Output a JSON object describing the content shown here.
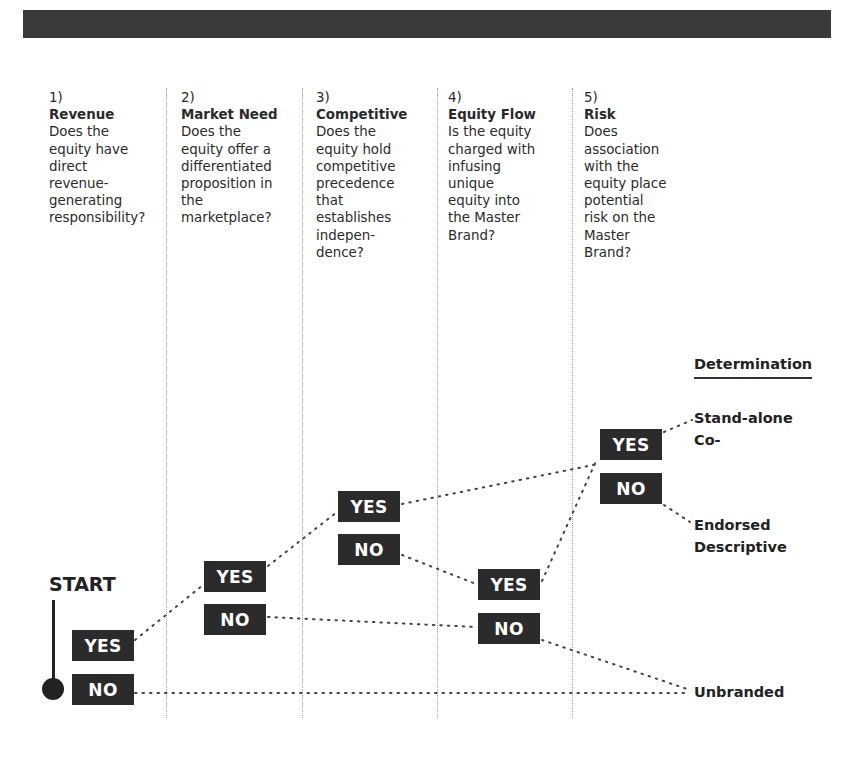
{
  "header_bar": {
    "color": "#3a3a3a"
  },
  "columns": [
    {
      "num": "1)",
      "title": "Revenue",
      "question": [
        "Does the",
        "equity have",
        "direct",
        "revenue-",
        "generating",
        "responsibility?"
      ]
    },
    {
      "num": "2)",
      "title": "Market Need",
      "question": [
        "Does the",
        "equity offer a",
        "differentiated",
        "proposition in",
        "the",
        "marketplace?"
      ]
    },
    {
      "num": "3)",
      "title": "Competitive",
      "question": [
        "Does the",
        "equity hold",
        "competitive",
        "precedence",
        "that",
        "establishes",
        "indepen-",
        "dence?"
      ]
    },
    {
      "num": "4)",
      "title": "Equity Flow",
      "question": [
        "Is the equity",
        "charged with",
        "infusing",
        "unique",
        "equity into",
        "the Master",
        "Brand?"
      ]
    },
    {
      "num": "5)",
      "title": "Risk",
      "question": [
        "Does",
        "association",
        "with the",
        "equity place",
        "potential",
        "risk on the",
        "Master",
        "Brand?"
      ]
    }
  ],
  "start_label": "START",
  "decisions": [
    {
      "yes": "YES",
      "no": "NO"
    },
    {
      "yes": "YES",
      "no": "NO"
    },
    {
      "yes": "YES",
      "no": "NO"
    },
    {
      "yes": "YES",
      "no": "NO"
    },
    {
      "yes": "YES",
      "no": "NO"
    }
  ],
  "determination": {
    "heading": "Determination",
    "outcomes": [
      "Stand-alone",
      "Co-",
      "Endorsed",
      "Descriptive",
      "Unbranded"
    ]
  },
  "flow": [
    {
      "from": "1-yes",
      "to": "2"
    },
    {
      "from": "1-no",
      "to": "Unbranded"
    },
    {
      "from": "2-yes",
      "to": "3"
    },
    {
      "from": "2-no",
      "to": "4"
    },
    {
      "from": "3-yes",
      "to": "5"
    },
    {
      "from": "3-no",
      "to": "4"
    },
    {
      "from": "4-yes",
      "to": "5"
    },
    {
      "from": "4-no",
      "to": "Unbranded"
    },
    {
      "from": "5-yes",
      "to": "Stand-alone / Co-"
    },
    {
      "from": "5-no",
      "to": "Endorsed / Descriptive"
    }
  ]
}
